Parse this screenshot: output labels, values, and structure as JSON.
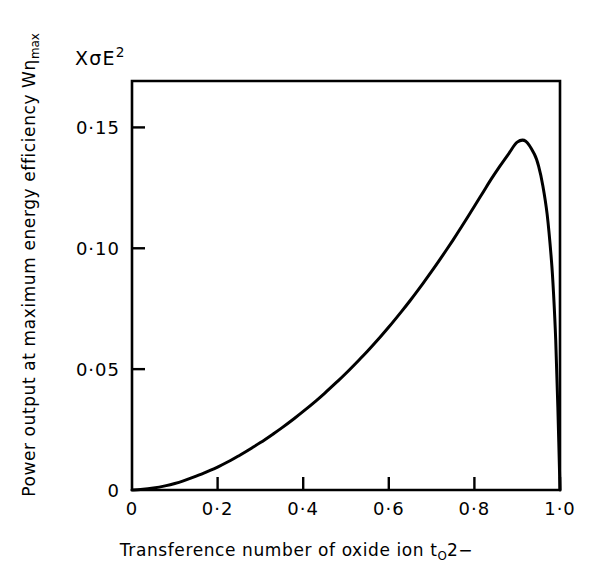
{
  "figure": {
    "unit_annotation": {
      "prefix": "X",
      "sigma": "σ",
      "e": "E",
      "exponent": "2"
    },
    "ylabel": {
      "main": "Power output at maximum energy efficiency W",
      "eta": "η",
      "subscript": "max"
    },
    "xlabel": {
      "main": "Transference number of oxide ion t",
      "subscript": "O",
      "charge": "2−"
    }
  },
  "chart_data": {
    "type": "line",
    "xlabel": "Transference number of oxide ion tO2−",
    "ylabel": "Power output at maximum energy efficiency Wηmax",
    "xlim": [
      0,
      1.0
    ],
    "ylim": [
      0,
      0.1692
    ],
    "grid": false,
    "legend": null,
    "line_color": "#000000",
    "xticks": [
      0,
      0.2,
      0.4,
      0.6,
      0.8,
      1.0
    ],
    "xticklabels": [
      "0",
      "0·2",
      "0·4",
      "0·6",
      "0·8",
      "1·0"
    ],
    "yticks": [
      0,
      0.05,
      0.1,
      0.15
    ],
    "yticklabels": [
      "0",
      "0·05",
      "0·10",
      "0·15"
    ],
    "peak": {
      "x": 0.9,
      "y": 0.145
    },
    "x": [
      0.0,
      0.02,
      0.05,
      0.08,
      0.1,
      0.12,
      0.15,
      0.18,
      0.2,
      0.23,
      0.25,
      0.28,
      0.3,
      0.33,
      0.35,
      0.38,
      0.4,
      0.43,
      0.45,
      0.48,
      0.5,
      0.53,
      0.55,
      0.58,
      0.6,
      0.63,
      0.65,
      0.68,
      0.7,
      0.72,
      0.75,
      0.77,
      0.8,
      0.82,
      0.84,
      0.86,
      0.88,
      0.9,
      0.92,
      0.94,
      0.95,
      0.96,
      0.97,
      0.98,
      0.985,
      0.99,
      0.995,
      1.0
    ],
    "y": [
      0.0,
      0.0002,
      0.0008,
      0.0018,
      0.0027,
      0.0038,
      0.0057,
      0.0079,
      0.0095,
      0.0122,
      0.0142,
      0.0174,
      0.0196,
      0.0232,
      0.0257,
      0.0297,
      0.0325,
      0.0369,
      0.04,
      0.0449,
      0.0483,
      0.0537,
      0.0574,
      0.0633,
      0.0674,
      0.0739,
      0.0784,
      0.0855,
      0.0904,
      0.0955,
      0.1034,
      0.1089,
      0.1174,
      0.1231,
      0.1288,
      0.1341,
      0.1391,
      0.1439,
      0.1443,
      0.139,
      0.134,
      0.1258,
      0.114,
      0.095,
      0.081,
      0.062,
      0.034,
      0.0
    ]
  }
}
